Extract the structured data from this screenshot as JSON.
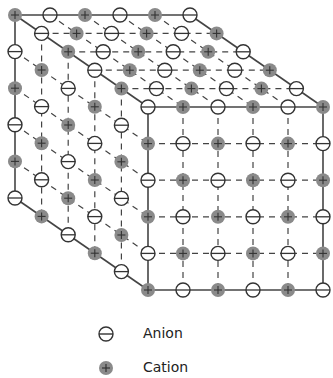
{
  "diagram": {
    "type": "rock-salt ionic crystal lattice (3D cube)",
    "lattice": {
      "atoms_per_edge": 6,
      "origin": [
        15,
        15
      ],
      "step_x": [
        35,
        0
      ],
      "step_y": [
        0,
        36.6
      ],
      "step_depth": [
        26.6,
        18.4
      ],
      "origin_species": "cation",
      "atom_radius": 7
    },
    "visible_faces": [
      "top",
      "left",
      "front"
    ],
    "colors": {
      "edge": "#444444",
      "dashed": "#444444",
      "cation_fill": "#8a8a8a",
      "cation_sign": "#333333",
      "anion_fill": "#ffffff",
      "anion_stroke": "#333333"
    }
  },
  "legend": {
    "items": [
      {
        "symbol": "anion",
        "label": "Anion"
      },
      {
        "symbol": "cation",
        "label": "Cation"
      }
    ]
  }
}
